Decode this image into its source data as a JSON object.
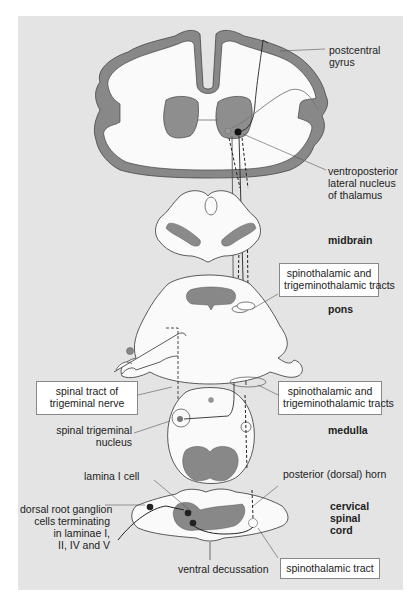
{
  "diagram": {
    "colors": {
      "background_panel": "#e4e4e4",
      "tissue_fill": "#fafafa",
      "grey_matter": "#8a8a8a",
      "outline": "#333333"
    },
    "labels": {
      "postcentral_gyrus": "postcentral\ngyrus",
      "vpl_nucleus": "ventroposterior\nlateral nucleus\nof thalamus",
      "midbrain": "midbrain",
      "pons": "pons",
      "medulla": "medulla",
      "cervical_spinal_cord": "cervical\nspinal\ncord",
      "spinal_trigeminal_nucleus": "spinal trigeminal\nnucleus",
      "lamina_i_cell": "lamina I cell",
      "posterior_horn": "posterior (dorsal) horn",
      "drg_cells": "dorsal root ganglion\ncells terminating\nin laminae I,\nII, IV and V",
      "ventral_decussation": "ventral decussation"
    },
    "boxes": {
      "spinothalamic_trigeminothalamic_pons": "spinothalamic and\ntrigeminothalamic tracts",
      "spinal_tract_trigeminal": "spinal tract of\ntrigeminal nerve",
      "spinothalamic_trigeminothalamic_medulla": "spinothalamic and\ntrigeminothalamic tracts",
      "spinothalamic_tract": "spinothalamic tract"
    }
  }
}
